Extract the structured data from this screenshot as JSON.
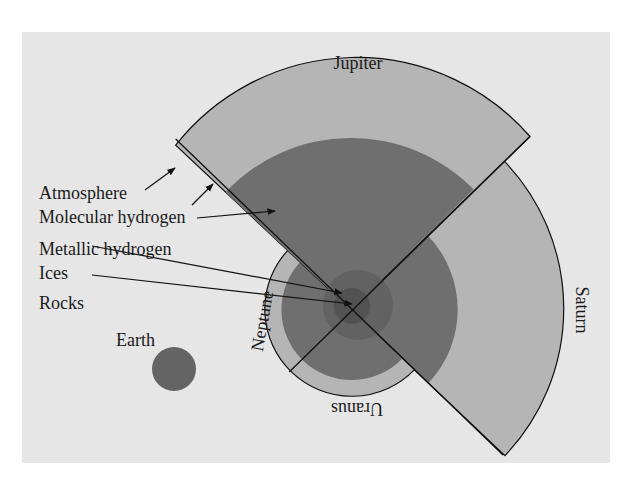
{
  "figure": {
    "background_color": "#e6e6e6",
    "colors": {
      "light_layer": "#b5b5b5",
      "dark_layer": "#6f6f6f",
      "ices_core": "#5e5e5e",
      "rocks_core": "#4f4f4f",
      "earth": "#646464",
      "outline": "#111111"
    },
    "planets": {
      "jupiter": "Jupiter",
      "saturn": "Saturn",
      "uranus": "Uranus",
      "neptune": "Neptune",
      "earth": "Earth"
    },
    "layer_labels": [
      {
        "id": "atmosphere",
        "text": "Atmosphere"
      },
      {
        "id": "molecular-hydrogen",
        "text": "Molecular hydrogen"
      },
      {
        "id": "metallic-hydrogen",
        "text": "Metallic hydrogen"
      },
      {
        "id": "ices",
        "text": "Ices"
      },
      {
        "id": "rocks",
        "text": "Rocks"
      }
    ]
  }
}
